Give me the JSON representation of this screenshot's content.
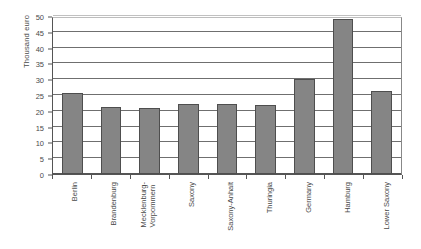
{
  "chart_data": {
    "type": "bar",
    "title": "",
    "subtitle": "",
    "xlabel": "",
    "ylabel": "Thousand euro",
    "categories": [
      "Berlin",
      "Brandenburg",
      "Mecklenburg-Vorpommern",
      "Saxony",
      "Saxony-Anhalt",
      "Thuringia",
      "Germany",
      "Hamburg",
      "Lower Saxony"
    ],
    "values": [
      25.5,
      21.3,
      21.0,
      22.3,
      22.2,
      21.9,
      30.2,
      49.0,
      26.4
    ],
    "ylim": [
      0,
      50
    ],
    "ytick_labels": [
      "0",
      "5",
      "10",
      "15",
      "20",
      "25",
      "30",
      "35",
      "40",
      "45",
      "50"
    ],
    "ytick_values": [
      0,
      5,
      10,
      15,
      20,
      25,
      30,
      35,
      40,
      45,
      50
    ],
    "ytick_step": 5,
    "grid": true,
    "grid_axis": "y",
    "legend": false,
    "legend_position": "none",
    "series": [
      {
        "name": "Thousand euro",
        "color": "#858585",
        "values": [
          25.5,
          21.3,
          21.0,
          22.3,
          22.2,
          21.9,
          30.2,
          49.0,
          26.4
        ]
      }
    ],
    "bar_color": "#858585",
    "bar_border_color": "#4e4e4e",
    "axis_color": "#555555",
    "gridline_color": "#6f6f6f",
    "background_color": "#ffffff",
    "annotations": []
  },
  "axis_labels": {
    "category_lines": [
      [
        "Berlin"
      ],
      [
        "Brandenburg"
      ],
      [
        "Mecklenburg-",
        "Vorpommern"
      ],
      [
        "Saxony"
      ],
      [
        "Saxony-Anhalt"
      ],
      [
        "Thuringia"
      ],
      [
        "Germany"
      ],
      [
        "Hamburg"
      ],
      [
        "Lower Saxony"
      ]
    ]
  }
}
